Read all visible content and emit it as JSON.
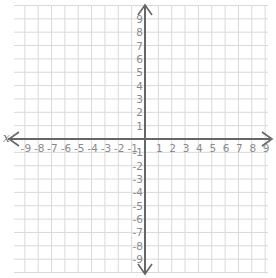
{
  "graph": {
    "title": "Coordinate plane",
    "x_axis_label": "x",
    "x_min": -9,
    "x_max": 9,
    "y_min": -9,
    "y_max": 9,
    "x_ticks_negative": [
      "-9",
      "-8",
      "-7",
      "-6",
      "-5",
      "-4",
      "-3",
      "-2",
      "-1"
    ],
    "x_ticks_positive": [
      "1",
      "2",
      "3",
      "4",
      "5",
      "6",
      "7",
      "8",
      "9"
    ],
    "y_ticks_positive": [
      "9",
      "8",
      "7",
      "6",
      "5",
      "4",
      "3",
      "2",
      "1"
    ],
    "y_ticks_negative": [
      "-1",
      "-2",
      "-3",
      "-4",
      "-5",
      "-6",
      "-7",
      "-8",
      "-9"
    ],
    "colors": {
      "grid": "#d9d9d9",
      "axis": "#666666",
      "tick_text": "#8a8a8a"
    }
  }
}
